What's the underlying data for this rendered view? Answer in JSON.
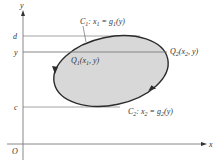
{
  "diagram": {
    "axes": {
      "x_label": "x",
      "y_label": "y",
      "origin_label": "O"
    },
    "y_ticks": {
      "d": "d",
      "y": "y",
      "c": "c"
    },
    "curve1": {
      "name": "C",
      "sub": "1",
      "eq_lhs": "x",
      "eq_lhs_sub": "1",
      "eq_rhs": "g",
      "eq_rhs_sub": "1",
      "eq_arg": "(y)"
    },
    "curve2": {
      "name": "C",
      "sub": "2",
      "eq_lhs": "x",
      "eq_lhs_sub": "2",
      "eq_rhs": "g",
      "eq_rhs_sub": "2",
      "eq_arg": "(y)"
    },
    "point1": {
      "name": "Q",
      "sub": "1",
      "coords_open": "(x",
      "coords_sub": "1",
      "coords_close": ", y)"
    },
    "point2": {
      "name": "Q",
      "sub": "2",
      "coords_open": "(x",
      "coords_sub": "2",
      "coords_close": ", y)"
    },
    "colors": {
      "region_fill": "#d8d8d8",
      "boundary": "#2b2b2b",
      "guide_lines": "#8a8a8a",
      "axes": "#7a7a7a"
    }
  }
}
